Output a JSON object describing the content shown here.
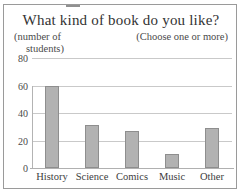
{
  "figure": {
    "title": "What kind of book do you like?",
    "y_axis_caption_line1": "(number of",
    "y_axis_caption_line2": "students)",
    "note": "(Choose one or more)"
  },
  "colors": {
    "bar_fill": "#b2b2b2",
    "bar_border": "#8e8e8e",
    "gridline": "#c9c9c9",
    "frame": "#9a9a9a",
    "text": "#3a3a3a"
  },
  "chart_data": {
    "type": "bar",
    "title": "What kind of book do you like?",
    "subtitle": "(Choose one or more)",
    "xlabel": "",
    "ylabel": "(number of students)",
    "categories": [
      "History",
      "Science",
      "Comics",
      "Music",
      "Other"
    ],
    "values": [
      60,
      31,
      27,
      10,
      29
    ],
    "yticks": [
      0,
      20,
      40,
      60,
      80
    ],
    "ytick_labels": [
      "0",
      "20",
      "40",
      "60",
      "80"
    ],
    "ylim": [
      0,
      80
    ],
    "grid": true,
    "legend": false,
    "orientation": "vertical"
  }
}
